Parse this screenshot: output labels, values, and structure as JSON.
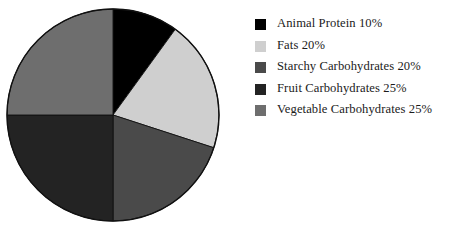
{
  "chart_data": {
    "type": "pie",
    "title": "",
    "subtitle": "",
    "xlabel": "",
    "ylabel": "",
    "grid": false,
    "legend_position": "right",
    "start_angle_deg": 0,
    "direction": "clockwise",
    "categories": [
      "Animal Protein",
      "Fats",
      "Starchy Carbohydrates",
      "Fruit Carbohydrates",
      "Vegetable Carbohydrates"
    ],
    "values": [
      10,
      20,
      20,
      25,
      25
    ],
    "value_unit": "%",
    "colors": [
      "#000000",
      "#cfcfcf",
      "#4a4a4a",
      "#232323",
      "#6e6e6e"
    ],
    "slices": [
      {
        "label": "Animal Protein",
        "value": 10,
        "display": "Animal Protein 10%",
        "color": "#000000",
        "sweep_deg": 36
      },
      {
        "label": "Fats",
        "value": 20,
        "display": "Fats 20%",
        "color": "#cfcfcf",
        "sweep_deg": 72
      },
      {
        "label": "Starchy Carbohydrates",
        "value": 20,
        "display": "Starchy Carbohydrates 20%",
        "color": "#4a4a4a",
        "sweep_deg": 72
      },
      {
        "label": "Fruit Carbohydrates",
        "value": 25,
        "display": "Fruit Carbohydrates 25%",
        "color": "#232323",
        "sweep_deg": 90
      },
      {
        "label": "Vegetable Carbohydrates",
        "value": 25,
        "display": "Vegetable Carbohydrates 25%",
        "color": "#6e6e6e",
        "sweep_deg": 90
      }
    ],
    "outline_color": "#111111"
  },
  "legend": {
    "items": [
      {
        "text": "Animal Protein 10%",
        "color": "#000000"
      },
      {
        "text": "Fats 20%",
        "color": "#cfcfcf"
      },
      {
        "text": "Starchy Carbohydrates 20%",
        "color": "#4a4a4a"
      },
      {
        "text": "Fruit Carbohydrates 25%",
        "color": "#232323"
      },
      {
        "text": "Vegetable Carbohydrates 25%",
        "color": "#6e6e6e"
      }
    ]
  }
}
